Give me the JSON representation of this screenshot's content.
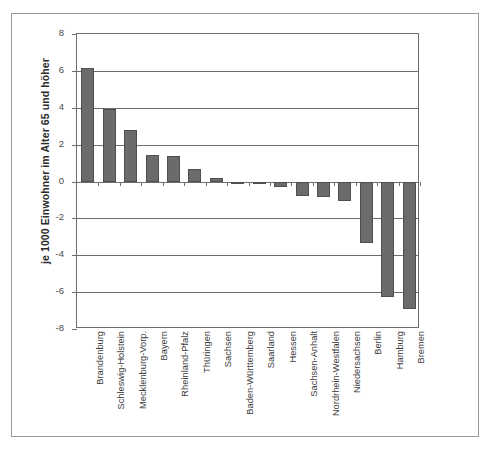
{
  "chart_data": {
    "type": "bar",
    "title": "",
    "subtitle": "",
    "xlabel": "",
    "ylabel": "je 1000 Einwohner im Alter 65 und höher",
    "ylim": [
      -8,
      8
    ],
    "yticks": [
      8,
      6,
      4,
      2,
      0,
      -2,
      -4,
      -6,
      -8
    ],
    "ytick_labels": [
      "8",
      "6",
      "4",
      "2",
      "0",
      "-2",
      "-4",
      "-6",
      "-8"
    ],
    "grid": true,
    "legend": "none",
    "orientation": "vertical",
    "bar_color": "#6b6b6b",
    "bar_edge_color": "#4f4f4f",
    "categories": [
      "Brandenburg",
      "Schleswig-Holstein",
      "Mecklenburg-Vorp.",
      "Bayern",
      "Rheinland-Pfalz",
      "Thüringen",
      "Sachsen",
      "Baden-Württemberg",
      "Saarland",
      "Hessen",
      "Sachsen-Anhalt",
      "Nordrhein-Westfalen",
      "Niedersachsen",
      "Berlin",
      "Hamburg",
      "Bremen"
    ],
    "values": [
      6.15,
      3.95,
      2.8,
      1.45,
      1.4,
      0.7,
      0.2,
      0.0,
      -0.1,
      -0.3,
      -0.8,
      -0.85,
      -1.05,
      -3.35,
      -6.25,
      -6.9
    ]
  }
}
